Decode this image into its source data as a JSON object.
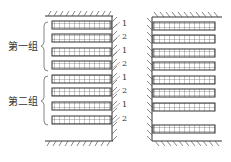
{
  "diagram": {
    "left_panel": {
      "groups": [
        {
          "label": "第一组"
        },
        {
          "label": "第二组"
        }
      ],
      "bar_numbers": [
        "1",
        "2",
        "1",
        "2",
        "1",
        "2",
        "1",
        "2"
      ]
    },
    "right_panel": {
      "bar_count": 8
    },
    "colors": {
      "line": "#333333",
      "background": "#ffffff"
    }
  }
}
